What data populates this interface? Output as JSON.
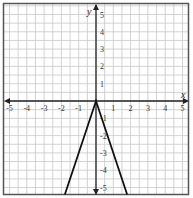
{
  "chart_data": {
    "type": "line",
    "title": "",
    "xlabel": "x",
    "ylabel": "y",
    "xlim": [
      -5.25,
      5.25
    ],
    "ylim": [
      -5.5,
      5.5
    ],
    "grid": true,
    "grid_step": 0.5,
    "x_ticks": [
      "-5",
      "-4",
      "-3",
      "-2",
      "-1",
      "1",
      "2",
      "3",
      "4",
      "5"
    ],
    "y_ticks": [
      "5",
      "4",
      "3",
      "2",
      "1",
      "-1",
      "-2",
      "-3",
      "-4",
      "-5"
    ],
    "series": [
      {
        "name": "y = -3|x|",
        "x": [
          -1.8,
          0,
          1.8
        ],
        "y": [
          -5.4,
          0,
          -5.4
        ]
      }
    ]
  }
}
